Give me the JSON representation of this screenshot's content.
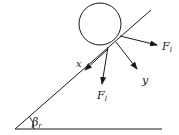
{
  "diagram": {
    "type": "free-body-diagram",
    "colors": {
      "stroke": "#1a1a1a",
      "background": "#ffffff"
    },
    "labels": {
      "force_normal_main": "F",
      "force_normal_sub": "l",
      "force_down_main": "F",
      "force_down_sub": "l",
      "axis_x": "x",
      "axis_y": "y",
      "angle_main": "β",
      "angle_sub": "r"
    }
  }
}
